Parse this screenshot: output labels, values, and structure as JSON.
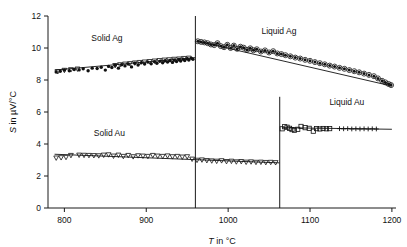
{
  "chart_data": {
    "type": "scatter",
    "title": "",
    "xlabel": "T in °C",
    "ylabel": "S in µV/°C",
    "xlabel_parts": {
      "symbol": "T",
      "rest": " in °C"
    },
    "ylabel_parts": {
      "symbol": "S",
      "rest": " in µV/°C"
    },
    "xlim": [
      780,
      1205
    ],
    "ylim": [
      0,
      12
    ],
    "xticks": [
      800,
      900,
      1000,
      1100,
      1200
    ],
    "yticks": [
      0,
      2,
      4,
      6,
      8,
      10,
      12
    ],
    "grid": false,
    "legend": "none",
    "annotations": [
      {
        "text": "Solid Ag",
        "x": 852,
        "y": 10.45
      },
      {
        "text": "Liquid Ag",
        "x": 1062,
        "y": 10.9
      },
      {
        "text": "Solid Au",
        "x": 855,
        "y": 4.5
      },
      {
        "text": "Liquid Au",
        "x": 1145,
        "y": 6.45
      }
    ],
    "vertical_lines": [
      {
        "x": 960,
        "y_from": 0,
        "y_to": 12,
        "label": "Ag melting point"
      },
      {
        "x": 1063,
        "y_from": 0,
        "y_to": 6.95,
        "label": "Au melting point"
      }
    ],
    "series": [
      {
        "name": "Solid Ag",
        "marker": "filled-circle",
        "fit": {
          "x": [
            788,
            960
          ],
          "y": [
            8.62,
            9.4
          ]
        },
        "x": [
          790,
          795,
          800,
          806,
          812,
          818,
          823,
          829,
          834,
          840,
          845,
          850,
          854,
          858,
          862,
          866,
          870,
          874,
          878,
          882,
          886,
          890,
          894,
          898,
          902,
          906,
          910,
          913,
          917,
          920,
          923,
          926,
          929,
          932,
          934,
          937,
          940,
          942,
          945,
          947,
          950,
          952,
          955,
          957
        ],
        "y": [
          8.5,
          8.55,
          8.62,
          8.58,
          8.66,
          8.63,
          8.7,
          8.58,
          8.74,
          8.72,
          8.8,
          8.62,
          8.85,
          8.78,
          8.92,
          8.74,
          8.95,
          8.88,
          9.0,
          8.82,
          9.05,
          8.94,
          9.08,
          9.0,
          9.12,
          9.02,
          9.15,
          9.05,
          9.18,
          9.08,
          9.2,
          9.12,
          9.22,
          9.1,
          9.25,
          9.16,
          9.28,
          9.18,
          9.3,
          9.22,
          9.33,
          9.25,
          9.36,
          9.3
        ]
      },
      {
        "name": "Solid Ag open",
        "marker": "open-triangle-down",
        "fit": null,
        "x": [
          792,
          800,
          808,
          816,
          862,
          868,
          874,
          880,
          886,
          892,
          898,
          904,
          910,
          916,
          922,
          928,
          934,
          940,
          946,
          952
        ],
        "y": [
          8.52,
          8.6,
          8.64,
          8.68,
          8.9,
          8.95,
          8.99,
          9.02,
          9.06,
          9.09,
          9.12,
          9.15,
          9.18,
          9.21,
          9.24,
          9.26,
          9.29,
          9.31,
          9.34,
          9.36
        ]
      },
      {
        "name": "Liquid Ag",
        "marker": "filled-circle-ring",
        "fit": {
          "x": [
            963,
            1200
          ],
          "y": [
            10.42,
            7.62
          ]
        },
        "x": [
          963,
          967,
          971,
          975,
          979,
          983,
          987,
          991,
          995,
          999,
          1003,
          1007,
          1011,
          1015,
          1019,
          1023,
          1027,
          1031,
          1035,
          1040,
          1045,
          1050,
          1055,
          1060,
          1065,
          1070,
          1076,
          1082,
          1088,
          1094,
          1100,
          1106,
          1112,
          1118,
          1124,
          1130,
          1136,
          1142,
          1148,
          1154,
          1160,
          1166,
          1172,
          1178,
          1183,
          1188,
          1192,
          1196,
          1199
        ],
        "y": [
          10.42,
          10.38,
          10.35,
          10.3,
          10.22,
          10.18,
          10.3,
          10.12,
          10.05,
          10.2,
          10.0,
          10.15,
          9.95,
          10.08,
          10.02,
          9.88,
          9.98,
          9.86,
          9.92,
          9.78,
          9.85,
          9.72,
          9.8,
          9.66,
          9.62,
          9.55,
          9.48,
          9.4,
          9.34,
          9.26,
          9.2,
          9.12,
          9.05,
          8.98,
          8.9,
          8.84,
          8.76,
          8.7,
          8.62,
          8.55,
          8.48,
          8.4,
          8.32,
          8.24,
          8.1,
          7.95,
          7.85,
          7.75,
          7.68
        ]
      },
      {
        "name": "Solid Au",
        "marker": "open-triangle-down",
        "fit": {
          "x": [
            788,
            1063
          ],
          "y": [
            3.36,
            2.82
          ]
        },
        "x": [
          790,
          796,
          802,
          808,
          818,
          824,
          830,
          836,
          842,
          848,
          854,
          860,
          866,
          872,
          878,
          884,
          890,
          896,
          902,
          908,
          914,
          920,
          926,
          932,
          938,
          944,
          950,
          956,
          962,
          968,
          974,
          980,
          986,
          992,
          998,
          1004,
          1010,
          1016,
          1022,
          1028,
          1034,
          1040,
          1046,
          1052,
          1058
        ],
        "y": [
          3.12,
          3.14,
          3.16,
          3.28,
          3.3,
          3.29,
          3.28,
          3.27,
          3.26,
          3.3,
          3.32,
          3.24,
          3.3,
          3.22,
          3.28,
          3.2,
          3.26,
          3.24,
          3.22,
          3.28,
          3.24,
          3.22,
          3.25,
          3.2,
          3.22,
          3.18,
          3.2,
          3.05,
          2.98,
          3.0,
          2.96,
          2.94,
          2.92,
          2.95,
          2.9,
          2.92,
          2.88,
          2.9,
          2.86,
          2.88,
          2.85,
          2.86,
          2.84,
          2.85,
          2.83
        ]
      },
      {
        "name": "Liquid Au",
        "marker": "open-square",
        "fit": {
          "x": [
            1066,
            1200
          ],
          "y": [
            5.02,
            4.92
          ]
        },
        "x": [
          1066,
          1069,
          1072,
          1075,
          1078,
          1081,
          1085,
          1089,
          1094,
          1099,
          1104,
          1108,
          1112,
          1116,
          1120,
          1124
        ],
        "y": [
          4.95,
          5.08,
          5.05,
          4.98,
          4.9,
          4.86,
          4.92,
          5.1,
          5.02,
          4.98,
          4.8,
          4.96,
          4.94,
          4.97,
          4.95,
          4.96
        ]
      },
      {
        "name": "Liquid Au plus",
        "marker": "plus",
        "fit": null,
        "x": [
          1136,
          1141,
          1146,
          1151,
          1156,
          1161,
          1166,
          1171,
          1176,
          1181
        ],
        "y": [
          4.96,
          4.95,
          4.96,
          4.94,
          4.95,
          4.94,
          4.95,
          4.94,
          4.95,
          4.94
        ]
      }
    ]
  }
}
